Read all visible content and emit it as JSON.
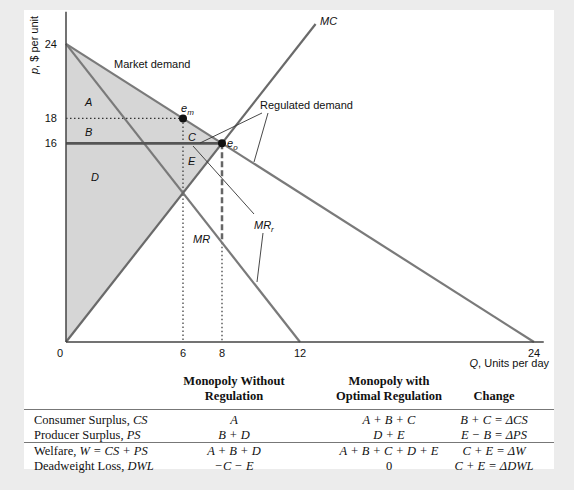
{
  "diagram": {
    "axes": {
      "ylabel_var": "p",
      "ylabel_rest": ", $ per unit",
      "xlabel_var": "Q",
      "xlabel_rest": ", Units per day",
      "x_ticks": [
        "0",
        "6",
        "8",
        "12",
        "24"
      ],
      "y_ticks": [
        "24",
        "18",
        "16"
      ]
    },
    "curves": {
      "market_demand": "Market demand",
      "regulated_demand": "Regulated demand",
      "mc": "MC",
      "mr": "MR",
      "mr_r_main": "MR",
      "mr_r_sub": "r"
    },
    "points": {
      "em_main": "e",
      "em_sub": "m",
      "eo_main": "e",
      "eo_sub": "o"
    },
    "areas": [
      "A",
      "B",
      "C",
      "D",
      "E"
    ],
    "colors": {
      "shading": "#d6d6d6",
      "curve": "#7a7a7a",
      "ceiling": "#555555",
      "background": "#ececec",
      "panel": "#ffffff"
    }
  },
  "table": {
    "headers": [
      "",
      "Monopoly Without Regulation",
      "Monopoly with Optimal Regulation",
      "Change"
    ],
    "header_lines": [
      [
        "",
        ""
      ],
      [
        "Monopoly Without",
        "Regulation"
      ],
      [
        "Monopoly with",
        "Optimal Regulation"
      ],
      [
        "",
        "Change"
      ]
    ],
    "rows": [
      {
        "label_plain": "Consumer Surplus, ",
        "label_it": "CS",
        "without": "A",
        "with": "A + B + C",
        "change": "B + C = ΔCS"
      },
      {
        "label_plain": "Producer Surplus, ",
        "label_it": "PS",
        "without": "B + D",
        "with": "D + E",
        "change": "E − B = ΔPS"
      },
      {
        "label_plain": "Welfare, ",
        "label_it": "W = CS + PS",
        "without": "A + B + D",
        "with": "A + B + C + D + E",
        "change": "C + E = ΔW"
      },
      {
        "label_plain": "Deadweight Loss, ",
        "label_it": "DWL",
        "without": "−C − E",
        "with": "0",
        "change": "C + E = ΔDWL"
      }
    ]
  }
}
